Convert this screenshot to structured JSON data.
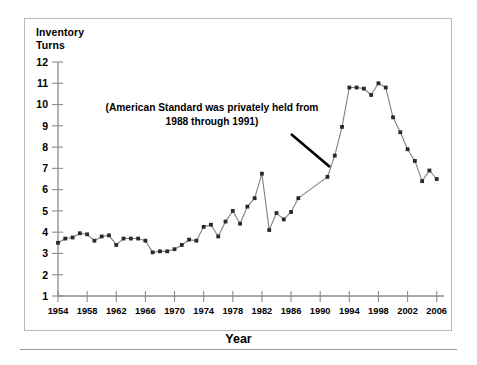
{
  "figure": {
    "y_axis_title": "Inventory\nTurns",
    "x_axis_title": "Year",
    "annotation": "(American Standard was privately held from 1988 through 1991)",
    "line_color": "#808080",
    "marker_color": "#2a2a2a",
    "axis_color": "#8c8c8c",
    "frame_color": "#b9b9b9"
  },
  "chart_data": {
    "type": "line",
    "title": "",
    "xlabel": "Year",
    "ylabel": "Inventory Turns",
    "xlim": [
      1954,
      2007
    ],
    "ylim": [
      1,
      12
    ],
    "grid": false,
    "legend": null,
    "xticks": [
      1954,
      1958,
      1962,
      1966,
      1970,
      1974,
      1978,
      1982,
      1986,
      1990,
      1994,
      1998,
      2002,
      2006
    ],
    "yticks": [
      1,
      2,
      3,
      4,
      5,
      6,
      7,
      8,
      9,
      10,
      11,
      12
    ],
    "annotations": [
      {
        "text": "(American Standard was privately held from 1988 through 1991)",
        "points_to_x": 1991,
        "points_to_y": 6.6
      }
    ],
    "series": [
      {
        "name": "Inventory Turns",
        "x": [
          1954,
          1955,
          1956,
          1957,
          1958,
          1959,
          1960,
          1961,
          1962,
          1963,
          1964,
          1965,
          1966,
          1967,
          1968,
          1969,
          1970,
          1971,
          1972,
          1973,
          1974,
          1975,
          1976,
          1977,
          1978,
          1979,
          1980,
          1981,
          1982,
          1983,
          1984,
          1985,
          1986,
          1987,
          1991,
          1992,
          1993,
          1994,
          1995,
          1996,
          1997,
          1998,
          1999,
          2000,
          2001,
          2002,
          2003,
          2004,
          2005,
          2006
        ],
        "y": [
          3.5,
          3.7,
          3.75,
          3.95,
          3.9,
          3.6,
          3.8,
          3.85,
          3.4,
          3.7,
          3.7,
          3.7,
          3.6,
          3.05,
          3.1,
          3.1,
          3.2,
          3.4,
          3.65,
          3.6,
          4.25,
          4.35,
          3.8,
          4.5,
          5.0,
          4.4,
          5.2,
          5.6,
          6.75,
          4.1,
          4.9,
          4.6,
          4.95,
          5.6,
          6.6,
          7.6,
          8.95,
          10.8,
          10.8,
          10.75,
          10.45,
          11.0,
          10.8,
          9.4,
          8.7,
          7.9,
          7.35,
          6.4,
          6.9,
          6.5
        ]
      }
    ]
  }
}
